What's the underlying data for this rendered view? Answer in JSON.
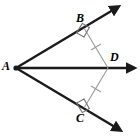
{
  "figure": {
    "type": "geometry-diagram",
    "canvas": {
      "width": 140,
      "height": 139,
      "background": "#ffffff"
    },
    "colors": {
      "ray_stroke": "#1a1a1a",
      "segment_stroke": "#9a9a9a",
      "tick_stroke": "#9a9a9a",
      "right_angle_stroke": "#6e6e6e",
      "label_text": "#000000"
    },
    "points": [
      {
        "id": "A",
        "label": "A",
        "x": 16,
        "y": 68,
        "label_x": 2,
        "label_y": 60,
        "marked": true
      },
      {
        "id": "B",
        "label": "B",
        "x": 84,
        "y": 28,
        "label_x": 76,
        "label_y": 12,
        "marked": false
      },
      {
        "id": "C",
        "label": "C",
        "x": 84,
        "y": 108,
        "label_x": 76,
        "label_y": 112,
        "marked": false
      },
      {
        "id": "D",
        "label": "D",
        "x": 108,
        "y": 68,
        "label_x": 110,
        "label_y": 51,
        "marked": false
      }
    ],
    "rays": [
      {
        "id": "ray-AB",
        "from": "A",
        "through": "B",
        "tip_x": 118,
        "tip_y": 5,
        "arrowhead": true,
        "width": 2.4
      },
      {
        "id": "ray-AD",
        "from": "A",
        "through": "D",
        "tip_x": 133,
        "tip_y": 68,
        "arrowhead": true,
        "width": 2.4
      },
      {
        "id": "ray-AC",
        "from": "A",
        "through": "C",
        "tip_x": 120,
        "tip_y": 131,
        "arrowhead": true,
        "width": 2.4
      }
    ],
    "segments": [
      {
        "id": "segment-BD",
        "from": "B",
        "to": "D",
        "style": "thin-gray",
        "ticks": 1,
        "tick_x": 96,
        "tick_y": 48
      },
      {
        "id": "segment-CD",
        "from": "C",
        "to": "D",
        "style": "thin-gray",
        "ticks": 1,
        "tick_x": 96,
        "tick_y": 88
      }
    ],
    "right_angles": [
      {
        "id": "right-angle-B",
        "at": "B",
        "size": 10
      },
      {
        "id": "right-angle-C",
        "at": "C",
        "size": 10
      }
    ]
  }
}
